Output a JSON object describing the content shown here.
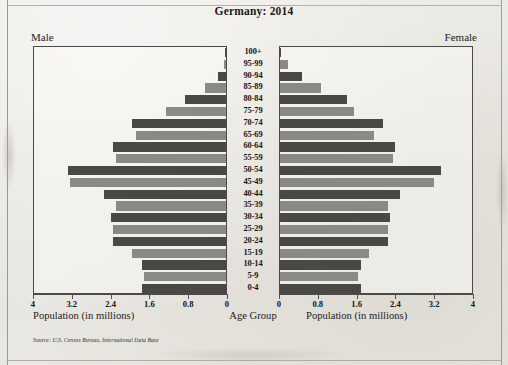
{
  "title": "Germany: 2014",
  "male_label": "Male",
  "female_label": "Female",
  "caption_left": "Population (in millions)",
  "caption_center": "Age Group",
  "caption_right": "Population (in millions)",
  "source": "Source: U.S. Census Bureau, International Data Base",
  "colors": {
    "bar_dark": "#4a4845",
    "bar_light": "#8b8986",
    "axis": "#4c4a46",
    "text": "#16150f",
    "paper": "#e9e7e1"
  },
  "chart_data": {
    "type": "bar",
    "subtype": "population-pyramid",
    "title": "Germany: 2014",
    "xlabel": "Population (in millions)",
    "ylabel": "Age Group",
    "grid": false,
    "legend_position": "top-outside",
    "xlim_left": [
      4,
      0
    ],
    "xlim_right": [
      0,
      4
    ],
    "xticks_left": [
      "4",
      "3.2",
      "2.4",
      "1.6",
      "0.8",
      "0"
    ],
    "xticks_right": [
      "0",
      "0.8",
      "1.6",
      "2.4",
      "3.2",
      "4"
    ],
    "xtick_values": [
      0,
      0.8,
      1.6,
      2.4,
      3.2,
      4
    ],
    "categories": [
      "100+",
      "95-99",
      "90-94",
      "85-89",
      "80-84",
      "75-79",
      "70-74",
      "65-69",
      "60-64",
      "55-59",
      "50-54",
      "45-49",
      "40-44",
      "35-39",
      "30-34",
      "25-29",
      "20-24",
      "15-19",
      "10-14",
      "5-9",
      "0-4"
    ],
    "series": [
      {
        "name": "Male",
        "side": "left",
        "values": [
          0.01,
          0.05,
          0.17,
          0.43,
          0.86,
          1.25,
          1.95,
          1.88,
          2.35,
          2.3,
          3.3,
          3.25,
          2.55,
          2.3,
          2.4,
          2.35,
          2.35,
          1.95,
          1.75,
          1.7,
          1.75
        ]
      },
      {
        "name": "Female",
        "side": "right",
        "values": [
          0.03,
          0.16,
          0.46,
          0.86,
          1.4,
          1.55,
          2.15,
          1.95,
          2.4,
          2.35,
          3.35,
          3.2,
          2.5,
          2.25,
          2.3,
          2.25,
          2.25,
          1.85,
          1.68,
          1.62,
          1.68
        ]
      }
    ]
  }
}
